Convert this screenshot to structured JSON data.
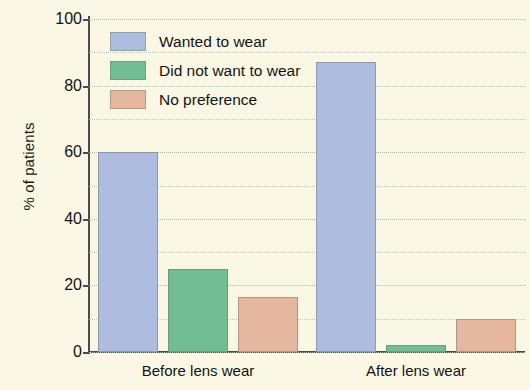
{
  "chart_data": {
    "type": "bar",
    "title": "",
    "xlabel": "",
    "ylabel": "% of patients",
    "ylim": [
      0,
      100
    ],
    "ytick_values": [
      0,
      20,
      40,
      60,
      80,
      100
    ],
    "ytick_labels": [
      "0",
      "20",
      "40",
      "60",
      "80",
      "100"
    ],
    "gridlines": {
      "visible": true,
      "style": "dotted",
      "step": 10
    },
    "categories": [
      "Before lens wear",
      "After lens wear"
    ],
    "legend": {
      "position": "upper-left-inside"
    },
    "series": [
      {
        "name": "Wanted to wear",
        "color": "#aebce0",
        "values": [
          60,
          87
        ]
      },
      {
        "name": "Did not want to wear",
        "color": "#72bd93",
        "values": [
          25,
          2
        ]
      },
      {
        "name": "No preference",
        "color": "#e5b79e",
        "values": [
          16.5,
          10
        ]
      }
    ]
  },
  "figure": {
    "background_color": "#faf8e4",
    "axis_color": "#4c4c44"
  }
}
